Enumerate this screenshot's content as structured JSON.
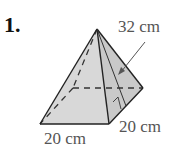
{
  "problem": {
    "number": "1.",
    "figure": "square-pyramid",
    "labels": {
      "slant_height": "32 cm",
      "base_front": "20 cm",
      "base_side": "20 cm"
    }
  },
  "colors": {
    "face_front": "#d6d6d6",
    "face_right": "#c8c8c8",
    "edge": "#222222",
    "label": "#555555"
  }
}
